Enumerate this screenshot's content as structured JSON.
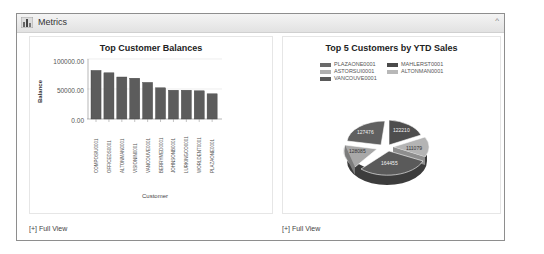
{
  "panel": {
    "title": "Metrics",
    "collapse_icon": "^"
  },
  "cards": [
    {
      "title": "Top Customer Balances",
      "full_view_label": "[+] Full View"
    },
    {
      "title": "Top 5 Customers by YTD Sales",
      "full_view_label": "[+] Full View"
    }
  ],
  "chart_data": [
    {
      "type": "bar",
      "title": "Top Customer Balances",
      "xlabel": "Customer",
      "ylabel": "Balance",
      "ylim": [
        0,
        100000
      ],
      "yticks": [
        "100000.00",
        "50000.00",
        "0.00"
      ],
      "grid": true,
      "categories": [
        "COMPOSIU0001",
        "OFFICEDS0001",
        "ALTONMAN0001",
        "VISIONIN0001",
        "VANCOUVE0001",
        "BERRYMED0001",
        "JOHNSONB0001",
        "LURKINGCO0001",
        "WORLDENT0001",
        "PLAZAONE0001"
      ],
      "values": [
        81000,
        77000,
        70000,
        68000,
        61000,
        52000,
        48000,
        48000,
        47000,
        42000
      ]
    },
    {
      "type": "pie",
      "title": "Top 5 Customers by YTD Sales",
      "legend_position": "top",
      "labels": [
        "PLAZAONE0001",
        "MAHLERST0001",
        "ASTORSUI0001",
        "ALTONMAN0001",
        "VANCOUVE0001"
      ],
      "values": [
        164455,
        122210,
        128085,
        111079,
        127476
      ],
      "colors": [
        "#5a5a5a",
        "#4e4e4e",
        "#a8a8a8",
        "#b4b4b4",
        "#606060"
      ]
    }
  ],
  "pie_labels": [
    "164455",
    "122210",
    "128085",
    "111079",
    "127476"
  ]
}
